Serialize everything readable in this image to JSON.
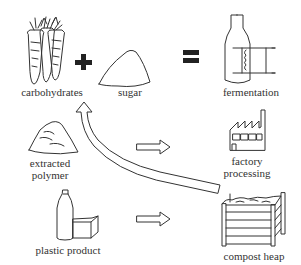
{
  "diagram": {
    "nodes": {
      "carbohydrates": {
        "label": "carbohydrates",
        "icon": "carrots-icon"
      },
      "sugar": {
        "label": "sugar",
        "icon": "sugar-pile-icon"
      },
      "fermentation": {
        "label": "fermentation",
        "icon": "fermentation-bottle-icon"
      },
      "extracted_polymer": {
        "label_line1": "extracted",
        "label_line2": "polymer",
        "icon": "polymer-pile-icon"
      },
      "factory_processing": {
        "label_line1": "factory",
        "label_line2": "processing",
        "icon": "factory-icon"
      },
      "plastic_product": {
        "label": "plastic product",
        "icon": "bottle-and-box-icon"
      },
      "compost_heap": {
        "label": "compost heap",
        "icon": "compost-bin-icon"
      }
    },
    "operators": {
      "plus": "+",
      "equals": "="
    },
    "edges": [
      {
        "from": "extracted_polymer",
        "to": "factory_processing",
        "style": "hollow-arrow"
      },
      {
        "from": "plastic_product",
        "to": "compost_heap",
        "style": "hollow-arrow"
      },
      {
        "from": "compost_heap",
        "to": "carbohydrates",
        "style": "curved-hollow-arrow"
      }
    ],
    "colors": {
      "line": "#333333",
      "background": "#ffffff"
    }
  }
}
